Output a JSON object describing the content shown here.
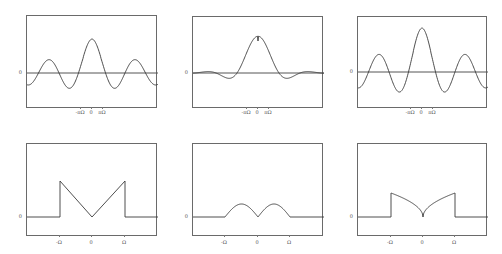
{
  "figure": {
    "background": "#ffffff",
    "line_color": "#3a3a3a",
    "frame_color": "#6a6a6a",
    "label_color": "#555555"
  },
  "chart_data": [
    {
      "id": "top-left",
      "type": "line",
      "title": "",
      "xlabel": "",
      "ylabel": "",
      "ytick_labels": [
        "0"
      ],
      "xtick_labels": [
        "-πΩ",
        "0",
        "πΩ"
      ],
      "description": "sinc-like signal, peak at 0 with slowly decaying oscillating sidelobes",
      "frame": {
        "x": 26,
        "y": 15,
        "w": 131,
        "h": 93
      },
      "zero_y": 72,
      "xticks_px": [
        80,
        91,
        102
      ],
      "curve": {
        "kind": "sinc_mix",
        "center_x": 91,
        "peak": 34,
        "period": 21,
        "sidelobe_gain": 1.0,
        "decay": 0.55
      }
    },
    {
      "id": "top-middle",
      "type": "line",
      "title": "",
      "xlabel": "",
      "ylabel": "",
      "ytick_labels": [
        "0"
      ],
      "xtick_labels": [
        "-πΩ",
        "0",
        "πΩ"
      ],
      "description": "smoother signal: main lobe with deep first sidelobes, rapidly vanishing tails",
      "frame": {
        "x": 192,
        "y": 16,
        "w": 131,
        "h": 92
      },
      "zero_y": 72,
      "xticks_px": [
        246,
        257,
        268
      ],
      "curve": {
        "kind": "fast_decay",
        "center_x": 257,
        "peak": 32,
        "period": 21,
        "sidelobe_gain": 1.0,
        "decay": 2.2
      }
    },
    {
      "id": "top-right",
      "type": "line",
      "title": "",
      "xlabel": "",
      "ylabel": "",
      "ytick_labels": [
        "0"
      ],
      "xtick_labels": [
        "-πΩ",
        "0",
        "πΩ"
      ],
      "description": "taller sinc-like signal with persistent oscillating sidelobes",
      "frame": {
        "x": 357,
        "y": 16,
        "w": 130,
        "h": 92
      },
      "zero_y": 71,
      "xticks_px": [
        410,
        421,
        432
      ],
      "curve": {
        "kind": "sinc_mix",
        "center_x": 421,
        "peak": 44,
        "period": 21,
        "sidelobe_gain": 1.1,
        "decay": 0.5
      }
    },
    {
      "id": "bottom-left",
      "type": "line",
      "title": "",
      "xlabel": "",
      "ylabel": "",
      "ytick_labels": [
        "0"
      ],
      "xtick_labels": [
        "-Ω",
        "0",
        "Ω"
      ],
      "description": "spectrum |ω| on [-Ω, Ω], zero outside: V shape with vertical jumps at ±Ω",
      "x": [
        -2,
        -1,
        -1,
        0,
        1,
        1,
        2
      ],
      "y": [
        0,
        0,
        1,
        0,
        1,
        0,
        0
      ],
      "frame": {
        "x": 26,
        "y": 143,
        "w": 131,
        "h": 93
      },
      "zero_y": 216,
      "xticks_px": [
        59,
        91,
        124
      ],
      "curve": {
        "kind": "v",
        "peak": 36
      }
    },
    {
      "id": "bottom-middle",
      "type": "line",
      "title": "",
      "xlabel": "",
      "ylabel": "",
      "ytick_labels": [
        "0"
      ],
      "xtick_labels": [
        "-Ω",
        "0",
        "Ω"
      ],
      "description": "spectrum |sin(πω/Ω)|-like double hump on [-Ω, Ω], continuous at ±Ω",
      "x": [
        -2,
        -1,
        -0.5,
        0,
        0.5,
        1,
        2
      ],
      "y": [
        0,
        0,
        1,
        0,
        1,
        0,
        0
      ],
      "frame": {
        "x": 192,
        "y": 143,
        "w": 131,
        "h": 93
      },
      "zero_y": 216,
      "xticks_px": [
        224,
        257,
        289
      ],
      "curve": {
        "kind": "humps",
        "peak": 13
      }
    },
    {
      "id": "bottom-right",
      "type": "line",
      "title": "",
      "xlabel": "",
      "ylabel": "",
      "ytick_labels": [
        "0"
      ],
      "xtick_labels": [
        "-Ω",
        "0",
        "Ω"
      ],
      "description": "spectrum sqrt-like |ω| on [-Ω, Ω] (concave V) with jumps at ±Ω",
      "x": [
        -2,
        -1,
        -1,
        0,
        1,
        1,
        2
      ],
      "y": [
        0,
        0,
        1,
        0,
        1,
        0,
        0
      ],
      "frame": {
        "x": 357,
        "y": 143,
        "w": 130,
        "h": 93
      },
      "zero_y": 216,
      "xticks_px": [
        390,
        422,
        454
      ],
      "curve": {
        "kind": "concave_v",
        "peak": 24
      }
    }
  ]
}
